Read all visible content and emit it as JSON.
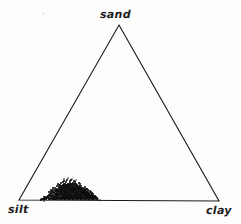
{
  "figure": {
    "kind": "ternary-scatter-diagram",
    "width": 241,
    "height": 224,
    "background_color": "#fdfdfc",
    "line_color": "#1a1a1a",
    "point_color": "#0d0d0d"
  },
  "labels": {
    "top": "sand",
    "bottom_left": "silt",
    "bottom_right": "clay"
  },
  "chart_data": {
    "type": "scatter",
    "title": "",
    "xlabel": "",
    "ylabel": "",
    "grid": false,
    "legend": "none",
    "axes": [
      "sand",
      "silt",
      "clay"
    ],
    "axis_order": "top=sand, bottom-left=silt, bottom-right=clay",
    "ternary_vertices_px": {
      "sand": [
        119,
        25
      ],
      "silt": [
        19,
        200
      ],
      "clay": [
        219,
        201
      ]
    },
    "note": "Soil texture ternary diagram; single dense sample cluster sits low on the silt-clay edge near the silt vertex (high silt, low-moderate clay, very low sand).",
    "cluster_summary": {
      "n_points_visible": 420,
      "sand_range_pct": [
        0,
        11
      ],
      "silt_range_pct": [
        58,
        85
      ],
      "clay_range_pct": [
        12,
        32
      ],
      "sand_mean_pct": 3,
      "silt_mean_pct": 73,
      "clay_mean_pct": 24
    },
    "points_px": [
      [
        46,
        199
      ],
      [
        48,
        197
      ],
      [
        49,
        199
      ],
      [
        50,
        196
      ],
      [
        50,
        199
      ],
      [
        51,
        194
      ],
      [
        51,
        198
      ],
      [
        52,
        196
      ],
      [
        52,
        199
      ],
      [
        53,
        192
      ],
      [
        53,
        195
      ],
      [
        53,
        198
      ],
      [
        54,
        193
      ],
      [
        54,
        196
      ],
      [
        54,
        199
      ],
      [
        55,
        190
      ],
      [
        55,
        194
      ],
      [
        55,
        197
      ],
      [
        55,
        199
      ],
      [
        56,
        191
      ],
      [
        56,
        194
      ],
      [
        56,
        196
      ],
      [
        56,
        199
      ],
      [
        57,
        189
      ],
      [
        57,
        192
      ],
      [
        57,
        195
      ],
      [
        57,
        198
      ],
      [
        58,
        190
      ],
      [
        58,
        193
      ],
      [
        58,
        196
      ],
      [
        58,
        198
      ],
      [
        59,
        188
      ],
      [
        59,
        191
      ],
      [
        59,
        194
      ],
      [
        59,
        197
      ],
      [
        59,
        199
      ],
      [
        60,
        187
      ],
      [
        60,
        190
      ],
      [
        60,
        192
      ],
      [
        60,
        195
      ],
      [
        60,
        198
      ],
      [
        61,
        186
      ],
      [
        61,
        189
      ],
      [
        61,
        191
      ],
      [
        61,
        194
      ],
      [
        61,
        197
      ],
      [
        61,
        199
      ],
      [
        62,
        188
      ],
      [
        62,
        190
      ],
      [
        62,
        193
      ],
      [
        62,
        196
      ],
      [
        62,
        198
      ],
      [
        63,
        185
      ],
      [
        63,
        187
      ],
      [
        63,
        190
      ],
      [
        63,
        192
      ],
      [
        63,
        195
      ],
      [
        63,
        197
      ],
      [
        63,
        199
      ],
      [
        64,
        186
      ],
      [
        64,
        189
      ],
      [
        64,
        191
      ],
      [
        64,
        194
      ],
      [
        64,
        196
      ],
      [
        64,
        198
      ],
      [
        65,
        184
      ],
      [
        65,
        187
      ],
      [
        65,
        190
      ],
      [
        65,
        192
      ],
      [
        65,
        195
      ],
      [
        65,
        197
      ],
      [
        65,
        199
      ],
      [
        66,
        186
      ],
      [
        66,
        188
      ],
      [
        66,
        191
      ],
      [
        66,
        193
      ],
      [
        66,
        196
      ],
      [
        66,
        198
      ],
      [
        67,
        185
      ],
      [
        67,
        187
      ],
      [
        67,
        190
      ],
      [
        67,
        192
      ],
      [
        67,
        194
      ],
      [
        67,
        197
      ],
      [
        67,
        199
      ],
      [
        68,
        184
      ],
      [
        68,
        186
      ],
      [
        68,
        189
      ],
      [
        68,
        191
      ],
      [
        68,
        193
      ],
      [
        68,
        196
      ],
      [
        68,
        198
      ],
      [
        69,
        185
      ],
      [
        69,
        188
      ],
      [
        69,
        190
      ],
      [
        69,
        192
      ],
      [
        69,
        195
      ],
      [
        69,
        197
      ],
      [
        69,
        199
      ],
      [
        70,
        183
      ],
      [
        70,
        186
      ],
      [
        70,
        189
      ],
      [
        70,
        191
      ],
      [
        70,
        194
      ],
      [
        70,
        196
      ],
      [
        70,
        198
      ],
      [
        71,
        185
      ],
      [
        71,
        187
      ],
      [
        71,
        190
      ],
      [
        71,
        192
      ],
      [
        71,
        195
      ],
      [
        71,
        197
      ],
      [
        71,
        199
      ],
      [
        72,
        184
      ],
      [
        72,
        186
      ],
      [
        72,
        189
      ],
      [
        72,
        191
      ],
      [
        72,
        193
      ],
      [
        72,
        196
      ],
      [
        72,
        198
      ],
      [
        73,
        185
      ],
      [
        73,
        188
      ],
      [
        73,
        190
      ],
      [
        73,
        192
      ],
      [
        73,
        195
      ],
      [
        73,
        197
      ],
      [
        73,
        199
      ],
      [
        74,
        184
      ],
      [
        74,
        187
      ],
      [
        74,
        189
      ],
      [
        74,
        191
      ],
      [
        74,
        194
      ],
      [
        74,
        196
      ],
      [
        74,
        198
      ],
      [
        75,
        186
      ],
      [
        75,
        188
      ],
      [
        75,
        190
      ],
      [
        75,
        193
      ],
      [
        75,
        195
      ],
      [
        75,
        197
      ],
      [
        75,
        199
      ],
      [
        76,
        185
      ],
      [
        76,
        187
      ],
      [
        76,
        189
      ],
      [
        76,
        192
      ],
      [
        76,
        194
      ],
      [
        76,
        196
      ],
      [
        76,
        198
      ],
      [
        77,
        186
      ],
      [
        77,
        188
      ],
      [
        77,
        191
      ],
      [
        77,
        193
      ],
      [
        77,
        195
      ],
      [
        77,
        197
      ],
      [
        77,
        199
      ],
      [
        78,
        187
      ],
      [
        78,
        189
      ],
      [
        78,
        192
      ],
      [
        78,
        194
      ],
      [
        78,
        196
      ],
      [
        78,
        198
      ],
      [
        79,
        188
      ],
      [
        79,
        190
      ],
      [
        79,
        193
      ],
      [
        79,
        195
      ],
      [
        79,
        197
      ],
      [
        79,
        199
      ],
      [
        80,
        187
      ],
      [
        80,
        189
      ],
      [
        80,
        191
      ],
      [
        80,
        194
      ],
      [
        80,
        196
      ],
      [
        80,
        198
      ],
      [
        81,
        188
      ],
      [
        81,
        190
      ],
      [
        81,
        192
      ],
      [
        81,
        195
      ],
      [
        81,
        197
      ],
      [
        81,
        199
      ],
      [
        82,
        189
      ],
      [
        82,
        191
      ],
      [
        82,
        193
      ],
      [
        82,
        196
      ],
      [
        82,
        198
      ],
      [
        83,
        190
      ],
      [
        83,
        192
      ],
      [
        83,
        194
      ],
      [
        83,
        197
      ],
      [
        83,
        199
      ],
      [
        84,
        191
      ],
      [
        84,
        193
      ],
      [
        84,
        195
      ],
      [
        84,
        198
      ],
      [
        85,
        190
      ],
      [
        85,
        192
      ],
      [
        85,
        194
      ],
      [
        85,
        196
      ],
      [
        85,
        199
      ],
      [
        86,
        193
      ],
      [
        86,
        195
      ],
      [
        86,
        197
      ],
      [
        86,
        199
      ],
      [
        87,
        192
      ],
      [
        87,
        194
      ],
      [
        87,
        196
      ],
      [
        87,
        198
      ],
      [
        88,
        193
      ],
      [
        88,
        195
      ],
      [
        88,
        197
      ],
      [
        88,
        199
      ],
      [
        89,
        194
      ],
      [
        89,
        196
      ],
      [
        89,
        198
      ],
      [
        90,
        193
      ],
      [
        90,
        195
      ],
      [
        90,
        197
      ],
      [
        90,
        199
      ],
      [
        91,
        196
      ],
      [
        91,
        198
      ],
      [
        92,
        195
      ],
      [
        92,
        197
      ],
      [
        92,
        199
      ],
      [
        93,
        196
      ],
      [
        93,
        198
      ],
      [
        94,
        197
      ],
      [
        94,
        199
      ],
      [
        95,
        198
      ],
      [
        44,
        199
      ],
      [
        45,
        197
      ],
      [
        47,
        198
      ],
      [
        51,
        196
      ],
      [
        52,
        193
      ],
      [
        54,
        198
      ],
      [
        56,
        197
      ],
      [
        58,
        195
      ],
      [
        60,
        193
      ],
      [
        62,
        191
      ],
      [
        64,
        192
      ],
      [
        66,
        194
      ],
      [
        68,
        195
      ],
      [
        70,
        193
      ],
      [
        72,
        191
      ],
      [
        74,
        192
      ],
      [
        76,
        193
      ],
      [
        78,
        191
      ],
      [
        80,
        192
      ],
      [
        82,
        194
      ],
      [
        84,
        196
      ],
      [
        86,
        191
      ],
      [
        88,
        192
      ],
      [
        61,
        183
      ],
      [
        66,
        182
      ],
      [
        70,
        181
      ],
      [
        73,
        183
      ],
      [
        64,
        181
      ],
      [
        68,
        184
      ],
      [
        59,
        185
      ],
      [
        75,
        184
      ],
      [
        79,
        186
      ],
      [
        83,
        188
      ],
      [
        57,
        186
      ],
      [
        55,
        188
      ],
      [
        53,
        190
      ],
      [
        51,
        192
      ],
      [
        49,
        195
      ],
      [
        47,
        197
      ],
      [
        43,
        199
      ],
      [
        41,
        200
      ],
      [
        92,
        193
      ],
      [
        90,
        191
      ],
      [
        87,
        189
      ],
      [
        85,
        187
      ],
      [
        81,
        186
      ],
      [
        77,
        185
      ],
      [
        71,
        180
      ],
      [
        67,
        180
      ],
      [
        63,
        182
      ],
      [
        58,
        184
      ],
      [
        62,
        186
      ],
      [
        65,
        188
      ],
      [
        69,
        187
      ],
      [
        73,
        186
      ],
      [
        76,
        184
      ],
      [
        80,
        184
      ],
      [
        84,
        189
      ],
      [
        88,
        190
      ],
      [
        91,
        192
      ],
      [
        93,
        194
      ],
      [
        95,
        196
      ],
      [
        50,
        194
      ],
      [
        48,
        196
      ],
      [
        46,
        198
      ],
      [
        44,
        197
      ],
      [
        42,
        199
      ],
      [
        96,
        197
      ],
      [
        97,
        199
      ],
      [
        79,
        183
      ],
      [
        74,
        181
      ],
      [
        70,
        185
      ],
      [
        66,
        185
      ],
      [
        60,
        188
      ],
      [
        56,
        190
      ],
      [
        52,
        191
      ],
      [
        59,
        190
      ],
      [
        63,
        188
      ],
      [
        67,
        186
      ],
      [
        71,
        184
      ],
      [
        75,
        182
      ],
      [
        81,
        189
      ],
      [
        85,
        193
      ],
      [
        89,
        195
      ],
      [
        93,
        197
      ],
      [
        49,
        198
      ],
      [
        45,
        199
      ],
      [
        53,
        199
      ],
      [
        57,
        199
      ],
      [
        61,
        199
      ],
      [
        65,
        199
      ],
      [
        69,
        199
      ],
      [
        73,
        199
      ],
      [
        77,
        199
      ],
      [
        81,
        199
      ],
      [
        85,
        199
      ],
      [
        89,
        199
      ],
      [
        93,
        199
      ],
      [
        97,
        198
      ],
      [
        55,
        199
      ],
      [
        59,
        198
      ],
      [
        63,
        198
      ],
      [
        67,
        198
      ],
      [
        71,
        198
      ],
      [
        75,
        198
      ],
      [
        79,
        198
      ],
      [
        83,
        198
      ],
      [
        87,
        198
      ],
      [
        91,
        198
      ],
      [
        54,
        197
      ],
      [
        58,
        197
      ],
      [
        62,
        197
      ],
      [
        66,
        197
      ],
      [
        70,
        197
      ],
      [
        74,
        197
      ],
      [
        78,
        197
      ],
      [
        82,
        197
      ],
      [
        86,
        197
      ],
      [
        90,
        197
      ],
      [
        94,
        198
      ],
      [
        56,
        195
      ],
      [
        60,
        195
      ],
      [
        64,
        195
      ],
      [
        68,
        194
      ],
      [
        72,
        194
      ],
      [
        76,
        195
      ],
      [
        80,
        195
      ],
      [
        84,
        195
      ],
      [
        88,
        196
      ],
      [
        92,
        196
      ],
      [
        57,
        193
      ],
      [
        61,
        192
      ],
      [
        65,
        193
      ],
      [
        69,
        193
      ],
      [
        73,
        192
      ],
      [
        77,
        193
      ],
      [
        81,
        193
      ],
      [
        85,
        195
      ],
      [
        89,
        197
      ],
      [
        58,
        191
      ],
      [
        62,
        189
      ],
      [
        66,
        190
      ],
      [
        70,
        190
      ],
      [
        74,
        190
      ],
      [
        78,
        190
      ],
      [
        82,
        192
      ],
      [
        86,
        194
      ],
      [
        90,
        196
      ],
      [
        59,
        187
      ],
      [
        63,
        186
      ],
      [
        67,
        188
      ],
      [
        71,
        188
      ],
      [
        75,
        188
      ],
      [
        79,
        189
      ],
      [
        83,
        192
      ],
      [
        87,
        194
      ],
      [
        60,
        185
      ],
      [
        64,
        184
      ],
      [
        68,
        187
      ],
      [
        72,
        187
      ],
      [
        76,
        187
      ],
      [
        80,
        188
      ],
      [
        84,
        193
      ],
      [
        61,
        188
      ],
      [
        65,
        186
      ],
      [
        69,
        189
      ],
      [
        73,
        189
      ],
      [
        77,
        189
      ],
      [
        81,
        191
      ],
      [
        62,
        194
      ],
      [
        66,
        192
      ],
      [
        72,
        196
      ],
      [
        78,
        196
      ],
      [
        82,
        190
      ],
      [
        86,
        189
      ],
      [
        64,
        197
      ],
      [
        68,
        197
      ],
      [
        76,
        191
      ],
      [
        84,
        191
      ],
      [
        88,
        194
      ],
      [
        92,
        194
      ],
      [
        94,
        196
      ],
      [
        96,
        199
      ],
      [
        49,
        192
      ],
      [
        51,
        190
      ],
      [
        53,
        188
      ],
      [
        55,
        192
      ],
      [
        57,
        191
      ],
      [
        63,
        194
      ],
      [
        67,
        196
      ],
      [
        71,
        196
      ],
      [
        75,
        196
      ],
      [
        52,
        197
      ]
    ],
    "sparse_outlier_points_px": [
      [
        44,
        201
      ],
      [
        41,
        199
      ],
      [
        98,
        199
      ],
      [
        100,
        200
      ],
      [
        72,
        179
      ],
      [
        68,
        178
      ],
      [
        64,
        179
      ],
      [
        76,
        180
      ]
    ]
  }
}
